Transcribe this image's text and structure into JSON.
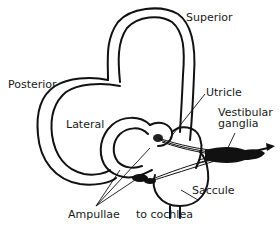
{
  "diagram": {
    "labels": {
      "superior": "Superior",
      "posterior": "Posterior",
      "lateral": "Lateral",
      "utricle": "Utricle",
      "vestibular_ganglia_line1": "Vestibular",
      "vestibular_ganglia_line2": "ganglia",
      "saccule": "Saccule",
      "ampullae": "Ampullae",
      "to_cochlea": "to cochlea"
    },
    "structures": [
      "superior-semicircular-canal",
      "posterior-semicircular-canal",
      "lateral-semicircular-canal",
      "utricle",
      "saccule",
      "ampullae",
      "vestibular-ganglia",
      "cochlear-duct-connection",
      "nerve-direction-arrow"
    ],
    "colors": {
      "line": "#111111",
      "background": "#ffffff"
    }
  }
}
